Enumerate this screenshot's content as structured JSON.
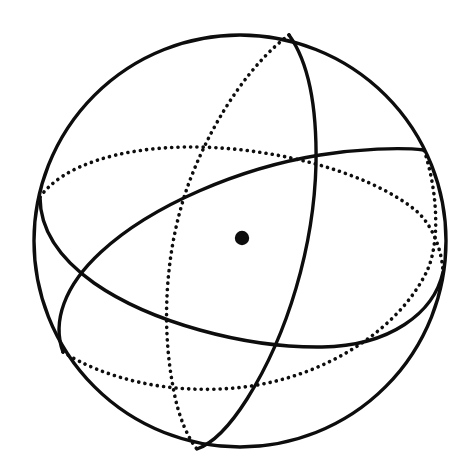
{
  "figure": {
    "title": "Sphere with three great circles",
    "background_color": "#ffffff",
    "ink_color": "#0d0d0d",
    "canvas": {
      "width": 472,
      "height": 475
    }
  },
  "sphere": {
    "name": "sphere-outline",
    "center_x": 240,
    "center_y": 241,
    "radius": 206,
    "stroke_width": 3.4,
    "stroke_color": "#0d0d0d",
    "fill": "none"
  },
  "center_marker": {
    "name": "center-dot",
    "cx": 242,
    "cy": 238,
    "r": 7.2,
    "fill_color": "#0d0d0d"
  },
  "line_styles": {
    "solid_stroke_width": 3.4,
    "dotted_stroke_width": 3.6,
    "dotted_dash_array": "0.1 6.2",
    "dotted_linecap": "round"
  },
  "great_circles": [
    {
      "name": "great-circle-horizontal",
      "label": "Near-horizontal great circle",
      "tilt_degrees": 11,
      "semi_major": 205,
      "semi_minor": 86,
      "front_half": "solid",
      "back_half": "dotted",
      "left_node_x": 40,
      "left_node_y": 198,
      "right_node_x": 443,
      "right_node_y": 276
    },
    {
      "name": "great-circle-diagonal",
      "label": "Diagonal great circle, lower-left to upper-right",
      "tilt_degrees": -28,
      "semi_major": 205,
      "semi_minor": 124,
      "front_half": "solid",
      "back_half": "dotted",
      "left_node_x": 59,
      "left_node_y": 342,
      "right_node_x": 424,
      "right_node_y": 148
    },
    {
      "name": "great-circle-vertical",
      "label": "Near-vertical great circle",
      "tilt_degrees": 79,
      "semi_major": 205,
      "semi_minor": 76,
      "front_half": "solid",
      "back_half": "dotted",
      "top_node_x": 288,
      "top_node_y": 36,
      "bottom_node_x": 199,
      "bottom_node_y": 449
    }
  ]
}
